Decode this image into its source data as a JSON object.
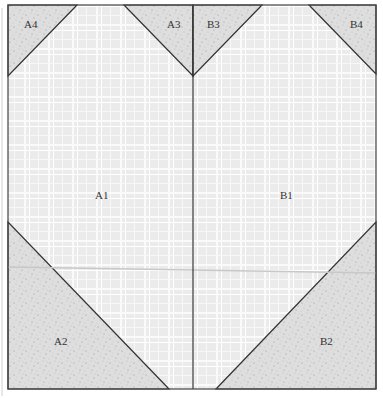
{
  "diagram": {
    "type": "quilt-block-pattern",
    "pieces": [
      {
        "id": "A1",
        "label": "A1",
        "fabric": "light-plaid"
      },
      {
        "id": "A2",
        "label": "A2",
        "fabric": "speckled-gray"
      },
      {
        "id": "A3",
        "label": "A3",
        "fabric": "speckled-gray"
      },
      {
        "id": "A4",
        "label": "A4",
        "fabric": "speckled-gray"
      },
      {
        "id": "B1",
        "label": "B1",
        "fabric": "light-plaid"
      },
      {
        "id": "B2",
        "label": "B2",
        "fabric": "speckled-gray"
      },
      {
        "id": "B3",
        "label": "B3",
        "fabric": "speckled-gray"
      },
      {
        "id": "B4",
        "label": "B4",
        "fabric": "speckled-gray"
      }
    ],
    "labels": {
      "A1": "A1",
      "A2": "A2",
      "A3": "A3",
      "A4": "A4",
      "B1": "B1",
      "B2": "B2",
      "B3": "B3",
      "B4": "B4"
    },
    "colors": {
      "plaid_bg": "#ececec",
      "plaid_line": "#ffffff",
      "speckle_bg": "#dcdcdc",
      "outline": "#333333"
    }
  }
}
